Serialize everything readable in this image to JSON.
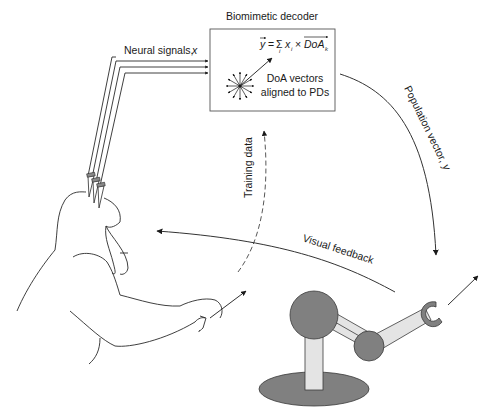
{
  "decoder": {
    "title": "Biomimetic decoder",
    "formula": {
      "lhs": "y",
      "equals": "=",
      "sum": "Σ",
      "sum_index": "i",
      "term": "x",
      "term_index": "i",
      "times": "×",
      "vector": "DoA",
      "vector_index": "k"
    },
    "caption_line1": "DoA vectors",
    "caption_line2": "aligned to PDs"
  },
  "labels": {
    "neural_signals": "Neural signals, ",
    "neural_signals_var": "x",
    "population_vector": "Population vector, ",
    "population_vector_var": "y",
    "training_data": "Training data",
    "visual_feedback": "Visual feedback"
  },
  "colors": {
    "stroke": "#2a2a2a",
    "robot_dark": "#808080",
    "robot_light": "#e4e4e4",
    "background": "#ffffff"
  },
  "icons": {
    "monkey": "monkey-outline-icon",
    "robot_arm": "robot-arm-icon",
    "electrode_array": "electrode-icon",
    "doa_star": "direction-vectors-star-icon"
  }
}
